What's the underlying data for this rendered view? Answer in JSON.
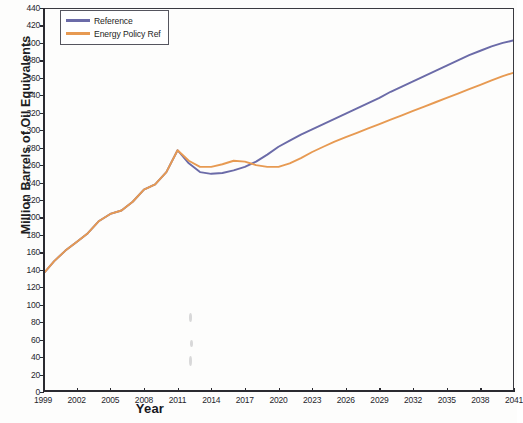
{
  "chart_data": {
    "type": "line",
    "title": "",
    "xlabel": "Year",
    "ylabel": "Million Barrels of Oil Equivalents",
    "xlim": [
      1999,
      2041
    ],
    "ylim": [
      0,
      440
    ],
    "ytick_step": 20,
    "xtick_step": 3,
    "grid": false,
    "legend_position": "top-left",
    "xticks": [
      "1999",
      "2002",
      "2005",
      "2008",
      "2011",
      "2014",
      "2017",
      "2020",
      "2023",
      "2026",
      "2029",
      "2032",
      "2035",
      "2038",
      "2041"
    ],
    "yticks": [
      "0",
      "20",
      "40",
      "60",
      "80",
      "100",
      "120",
      "140",
      "160",
      "180",
      "200",
      "220",
      "240",
      "260",
      "280",
      "300",
      "320",
      "340",
      "360",
      "380",
      "400",
      "420",
      "440"
    ],
    "x": [
      1999,
      2000,
      2001,
      2002,
      2003,
      2004,
      2005,
      2006,
      2007,
      2008,
      2009,
      2010,
      2011,
      2012,
      2013,
      2014,
      2015,
      2016,
      2017,
      2018,
      2019,
      2020,
      2021,
      2022,
      2023,
      2024,
      2025,
      2026,
      2027,
      2028,
      2029,
      2030,
      2031,
      2032,
      2033,
      2034,
      2035,
      2036,
      2037,
      2038,
      2039,
      2040,
      2041
    ],
    "series": [
      {
        "name": "Reference",
        "color": "#6b6ba8",
        "values": [
          135,
          150,
          162,
          172,
          182,
          196,
          204,
          208,
          218,
          232,
          238,
          252,
          277,
          262,
          252,
          250,
          251,
          254,
          258,
          264,
          272,
          281,
          288,
          295,
          301,
          307,
          313,
          319,
          325,
          331,
          337,
          344,
          350,
          356,
          362,
          368,
          374,
          380,
          386,
          391,
          396,
          400,
          403
        ]
      },
      {
        "name": "Energy Policy Ref",
        "color": "#e79a52",
        "values": [
          135,
          150,
          162,
          172,
          182,
          196,
          204,
          208,
          218,
          232,
          238,
          252,
          277,
          265,
          258,
          258,
          261,
          265,
          264,
          260,
          258,
          258,
          262,
          268,
          275,
          281,
          287,
          292,
          297,
          302,
          307,
          312,
          317,
          322,
          327,
          332,
          337,
          342,
          347,
          352,
          357,
          362,
          366
        ]
      }
    ]
  },
  "legend": {
    "items": [
      {
        "label": "Reference",
        "color": "#6b6ba8"
      },
      {
        "label": "Energy Policy Ref",
        "color": "#e79a52"
      }
    ]
  },
  "axes": {
    "x_title": "Year",
    "y_title": "Million Barrels of Oil Equivalents"
  }
}
